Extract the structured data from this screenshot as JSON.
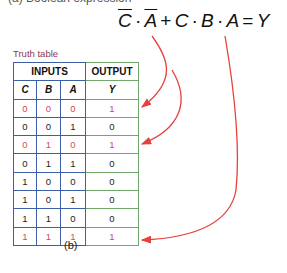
{
  "top_caption": "(a) Boolean expression",
  "expression": {
    "terms": [
      {
        "type": "var",
        "text": "C",
        "bar": true
      },
      {
        "type": "op",
        "text": "·"
      },
      {
        "type": "var",
        "text": "A",
        "bar": true
      },
      {
        "type": "op",
        "text": "+"
      },
      {
        "type": "var",
        "text": "C",
        "bar": false
      },
      {
        "type": "op",
        "text": "·"
      },
      {
        "type": "var",
        "text": "B",
        "bar": false
      },
      {
        "type": "op",
        "text": "·"
      },
      {
        "type": "var",
        "text": "A",
        "bar": false
      },
      {
        "type": "op",
        "text": "="
      },
      {
        "type": "var",
        "text": "Y",
        "bar": false
      }
    ]
  },
  "truth_table": {
    "title": "Truth table",
    "group_headers": {
      "inputs": "INPUTS",
      "output": "OUTPUT"
    },
    "columns": [
      "C",
      "B",
      "A",
      "Y"
    ],
    "rows": [
      {
        "C": "0",
        "B": "0",
        "A": "0",
        "Y": "1",
        "highlight": true
      },
      {
        "C": "0",
        "B": "0",
        "A": "1",
        "Y": "0",
        "highlight": false
      },
      {
        "C": "0",
        "B": "1",
        "A": "0",
        "Y": "1",
        "highlight": true
      },
      {
        "C": "0",
        "B": "1",
        "A": "1",
        "Y": "0",
        "highlight": false
      },
      {
        "C": "1",
        "B": "0",
        "A": "0",
        "Y": "0",
        "highlight": false
      },
      {
        "C": "1",
        "B": "0",
        "A": "1",
        "Y": "0",
        "highlight": false
      },
      {
        "C": "1",
        "B": "1",
        "A": "0",
        "Y": "0",
        "highlight": false
      },
      {
        "C": "1",
        "B": "1",
        "A": "1",
        "Y": "1",
        "highlight": true
      }
    ]
  },
  "caption": "(b)",
  "colors": {
    "highlight": "#cf4a6a",
    "arrow": "#e8403a",
    "inputs_border": "#3d5fa6",
    "output_border": "#6fa86a"
  }
}
